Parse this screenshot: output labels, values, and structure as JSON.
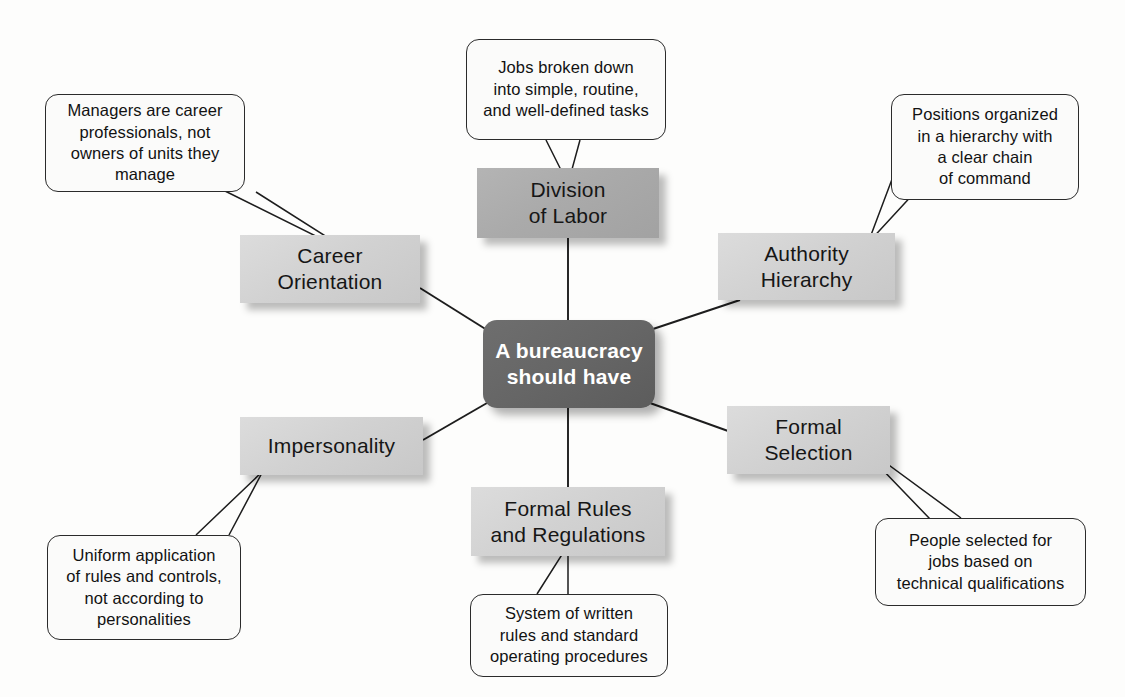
{
  "diagram": {
    "title": "A bureaucracy should have",
    "center": {
      "label": "A bureaucracy\nshould have",
      "color": "#666666",
      "text_color": "#ffffff"
    },
    "colors": {
      "background": "#fdfdfc",
      "concept_light": "#d2d2d2",
      "concept_mid": "#aaaaaa",
      "callout_fill": "#fbfbfa",
      "callout_border": "#2b2b2b",
      "line": "#1d1d1d"
    },
    "concepts": [
      {
        "id": "division-of-labor",
        "label": "Division\nof Labor",
        "shade": "mid"
      },
      {
        "id": "authority-hierarchy",
        "label": "Authority\nHierarchy",
        "shade": "light"
      },
      {
        "id": "formal-selection",
        "label": "Formal\nSelection",
        "shade": "light"
      },
      {
        "id": "formal-rules-regulations",
        "label": "Formal Rules\nand Regulations",
        "shade": "light"
      },
      {
        "id": "impersonality",
        "label": "Impersonality",
        "shade": "light"
      },
      {
        "id": "career-orientation",
        "label": "Career\nOrientation",
        "shade": "light"
      }
    ],
    "callouts": [
      {
        "id": "callout-division-of-labor",
        "for": "division-of-labor",
        "text": "Jobs broken down\ninto simple, routine,\nand well-defined tasks"
      },
      {
        "id": "callout-authority-hierarchy",
        "for": "authority-hierarchy",
        "text": "Positions organized\nin a hierarchy with\na clear chain\nof command"
      },
      {
        "id": "callout-formal-selection",
        "for": "formal-selection",
        "text": "People selected for\njobs based on\ntechnical qualifications"
      },
      {
        "id": "callout-formal-rules-regulations",
        "for": "formal-rules-regulations",
        "text": "System of written\nrules and standard\noperating procedures"
      },
      {
        "id": "callout-impersonality",
        "for": "impersonality",
        "text": "Uniform application\nof rules and controls,\nnot according to\npersonalities"
      },
      {
        "id": "callout-career-orientation",
        "for": "career-orientation",
        "text": "Managers are career\nprofessionals, not\nowners of units they\nmanage"
      }
    ]
  }
}
